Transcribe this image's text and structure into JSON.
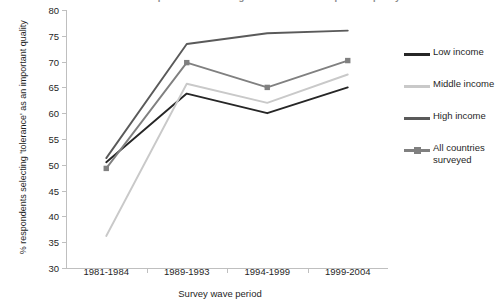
{
  "chart_data": {
    "type": "line",
    "title": "Trends in respondents selecting 'tolerance' as an important quality",
    "xlabel": "Survey wave period",
    "ylabel": "% respondents selecting 'tolerance' as an important quality",
    "categories": [
      "1981-1984",
      "1989-1993",
      "1994-1999",
      "1999-2004"
    ],
    "ylim": [
      30,
      80
    ],
    "ytick_step": 5,
    "yticks": [
      80,
      75,
      70,
      65,
      60,
      55,
      50,
      45,
      40,
      35,
      30
    ],
    "grid": false,
    "legend_position": "right",
    "series": [
      {
        "name": "Low income",
        "color": "#262626",
        "marker": "none",
        "values": [
          50.5,
          63.8,
          60.0,
          65.0
        ]
      },
      {
        "name": "Middle income",
        "color": "#c9c9c9",
        "marker": "none",
        "values": [
          36.2,
          65.7,
          62.0,
          67.5
        ]
      },
      {
        "name": "High income",
        "color": "#5a5a5a",
        "marker": "none",
        "values": [
          51.3,
          73.4,
          75.5,
          76.0
        ]
      },
      {
        "name": "All countries surveyed",
        "color": "#808080",
        "marker": "square",
        "values": [
          49.3,
          69.8,
          65.0,
          70.2
        ]
      }
    ]
  },
  "legend": {
    "items": [
      {
        "label": "Low income"
      },
      {
        "label": "Middle income"
      },
      {
        "label": "High income"
      },
      {
        "label": "All countries surveyed"
      }
    ]
  }
}
